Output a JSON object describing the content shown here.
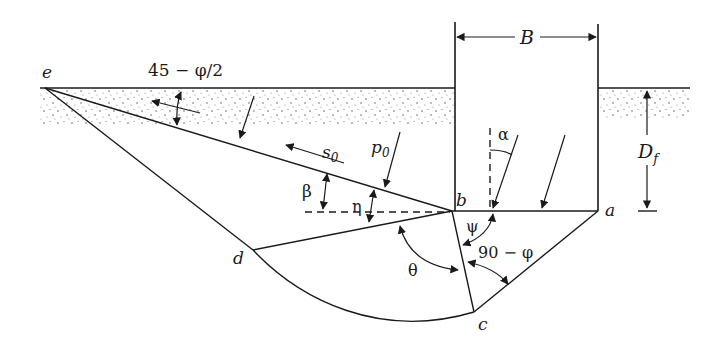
{
  "diagram": {
    "points": {
      "e": "e",
      "b": "b",
      "a": "a",
      "c": "c",
      "d": "d"
    },
    "dimensions": {
      "width": "B",
      "depth_main": "D",
      "depth_sub": "f"
    },
    "angles": {
      "top_wedge": "45 − φ/2",
      "alpha": "α",
      "beta": "β",
      "eta": "η",
      "psi": "ψ",
      "theta": "θ",
      "ninety_minus_phi": "90 − φ"
    },
    "forces": {
      "shear_main": "s",
      "shear_sub": "0",
      "normal_main": "p",
      "normal_sub": "0"
    },
    "colors": {
      "ink": "#1a1a1a",
      "background": "#ffffff"
    }
  }
}
